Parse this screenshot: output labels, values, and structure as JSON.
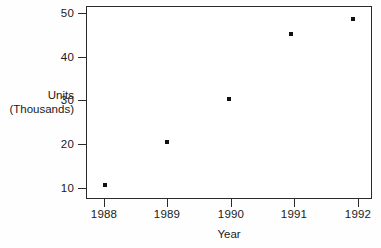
{
  "chart_data": {
    "type": "scatter",
    "title": "",
    "xlabel": "Year",
    "ylabel_line1": "Units",
    "ylabel_line2": "(Thousands)",
    "x": [
      1988,
      1989,
      1990,
      1991,
      1992
    ],
    "values": [
      10,
      20,
      30,
      45,
      48.5
    ],
    "xtick_labels": [
      "1988",
      "1989",
      "1990",
      "1991",
      "1992"
    ],
    "ytick_labels": [
      "50",
      "40",
      "30",
      "20",
      "10"
    ],
    "ytick_values": [
      50,
      40,
      30,
      20,
      10
    ],
    "xlim": [
      1987.7,
      1992.3
    ],
    "ylim": [
      6.8,
      51.5
    ],
    "grid": false,
    "legend": false,
    "marker": "square",
    "marker_color": "#111111",
    "axis_color": "#2b2b2b",
    "background_color": "#ffffff"
  }
}
